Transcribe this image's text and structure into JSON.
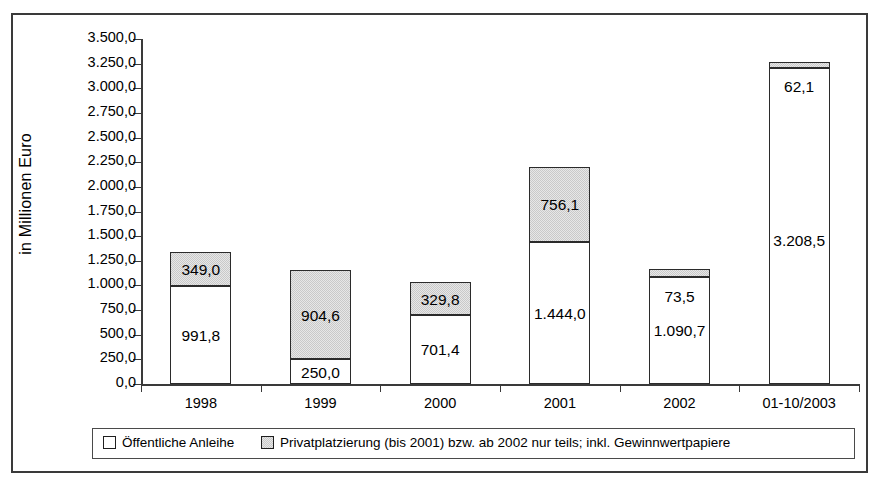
{
  "chart_data": {
    "type": "bar",
    "subtype": "stacked-bar",
    "title": "",
    "xlabel": "",
    "ylabel": "in Millionen Euro",
    "ylim": [
      0,
      3500
    ],
    "ytick_step": 250,
    "grid": false,
    "legend_position": "bottom",
    "categories": [
      "1998",
      "1999",
      "2000",
      "2001",
      "2002",
      "01-10/2003"
    ],
    "ytick_labels": [
      "0,0",
      "250,0",
      "500,0",
      "750,0",
      "1.000,0",
      "1.250,0",
      "1.500,0",
      "1.750,0",
      "2.000,0",
      "2.250,0",
      "2.500,0",
      "2.750,0",
      "3.000,0",
      "3.250,0",
      "3.500,0"
    ],
    "ytick_values": [
      0,
      250,
      500,
      750,
      1000,
      1250,
      1500,
      1750,
      2000,
      2250,
      2500,
      2750,
      3000,
      3250,
      3500
    ],
    "series": [
      {
        "name": "Öffentliche Anleihe",
        "color": "#ffffff",
        "values": [
          991.8,
          250.0,
          701.4,
          1444.0,
          1090.7,
          3208.5
        ],
        "labels": [
          "991,8",
          "250,0",
          "701,4",
          "1.444,0",
          "1.090,7",
          "3.208,5"
        ]
      },
      {
        "name": "Privatplatzierung (bis 2001) bzw. ab 2002 nur teils; inkl. Gewinnwertpapiere",
        "color": "#c9c9c9",
        "values": [
          349.0,
          904.6,
          329.8,
          756.1,
          73.5,
          62.1
        ],
        "labels": [
          "349,0",
          "904,6",
          "329,8",
          "756,1",
          "73,5",
          "62,1"
        ]
      }
    ],
    "totals": [
      1340.8,
      1154.6,
      1031.2,
      2200.1,
      1164.2,
      3270.6
    ]
  },
  "legend": {
    "entries": [
      {
        "label": "Öffentliche Anleihe",
        "swatch": "white-square-swatch"
      },
      {
        "label": "Privatplatzierung (bis 2001) bzw. ab 2002 nur teils; inkl. Gewinnwertpapiere",
        "swatch": "gray-square-swatch"
      }
    ]
  }
}
